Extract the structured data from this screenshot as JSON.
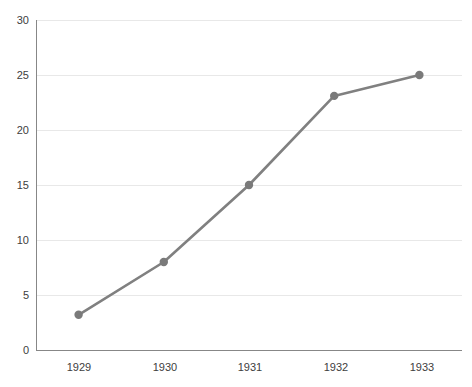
{
  "chart_data": {
    "type": "line",
    "title": "",
    "xlabel": "",
    "ylabel": "",
    "categories": [
      "1929",
      "1930",
      "1931",
      "1932",
      "1933"
    ],
    "values": [
      3.2,
      8.0,
      15.0,
      23.1,
      25.0
    ],
    "series": [
      {
        "name": "series-1",
        "values": [
          3.2,
          8.0,
          15.0,
          23.1,
          25.0
        ]
      }
    ],
    "ylim": [
      0,
      30
    ],
    "ytick_values": [
      0,
      5,
      10,
      15,
      20,
      25,
      30
    ],
    "ytick_labels": [
      "0",
      "5",
      "10",
      "15",
      "20",
      "25",
      "30"
    ],
    "xtick_labels": [
      "1929",
      "1930",
      "1931",
      "1932",
      "1933"
    ],
    "grid": "horizontal",
    "legend": "none",
    "marker": "circle"
  },
  "style": {
    "line_color": "#808080",
    "marker_color": "#7a7a7a",
    "grid_color": "#e8e8e8",
    "axis_color": "#878787",
    "tick_label_color": "#404040",
    "background": "#ffffff"
  },
  "axis": {
    "y_labels": [
      "30",
      "25",
      "20",
      "15",
      "10",
      "5",
      "0"
    ],
    "x_labels": [
      "1929",
      "1930",
      "1931",
      "1932",
      "1933"
    ]
  }
}
